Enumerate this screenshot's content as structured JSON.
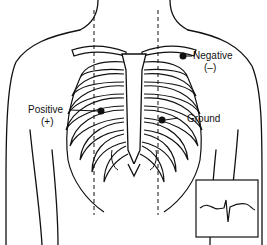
{
  "diagram": {
    "labels": {
      "negative": "Negative",
      "negative_sign": "(–)",
      "positive": "Positive",
      "positive_sign": "(+)",
      "ground": "Ground"
    },
    "colors": {
      "line": "#111111",
      "background": "#ffffff"
    }
  }
}
